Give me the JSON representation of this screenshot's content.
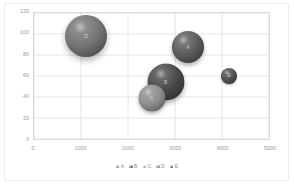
{
  "chart_data": {
    "type": "scatter",
    "subtype": "bubble",
    "title": "",
    "xlabel": "",
    "ylabel": "",
    "xlim": [
      0,
      5000
    ],
    "ylim": [
      0,
      120
    ],
    "xticks": [
      "0",
      "1000",
      "2000",
      "3000",
      "4000",
      "5000"
    ],
    "xtick_values": [
      0,
      1000,
      2000,
      3000,
      4000,
      5000
    ],
    "yticks": [
      "0",
      "20",
      "40",
      "60",
      "80",
      "100",
      "120"
    ],
    "ytick_values": [
      0,
      20,
      40,
      60,
      80,
      100,
      120
    ],
    "grid": true,
    "grid_color": "#d9d9d9",
    "legend_position": "bottom",
    "series": [
      {
        "name": "A",
        "label": "A",
        "x": 3250,
        "y": 88,
        "size": 32,
        "color": "#5a5a5a",
        "radius_px": 16
      },
      {
        "name": "B",
        "label": "B",
        "x": 2780,
        "y": 55,
        "size": 37,
        "color": "#484848",
        "radius_px": 18.5
      },
      {
        "name": "C",
        "label": "C",
        "x": 2480,
        "y": 40,
        "size": 27,
        "color": "#8e8e8e",
        "radius_px": 13.5
      },
      {
        "name": "D",
        "label": "D",
        "x": 1100,
        "y": 98,
        "size": 42,
        "color": "#747474",
        "radius_px": 21
      },
      {
        "name": "E",
        "label": "E",
        "x": 4120,
        "y": 61,
        "size": 16,
        "color": "#4f4f4f",
        "radius_px": 8
      }
    ],
    "legend": [
      {
        "label": "A",
        "color": "#6e6e6e"
      },
      {
        "label": "B",
        "color": "#3f3f3f"
      },
      {
        "label": "C",
        "color": "#9a9a9a"
      },
      {
        "label": "D",
        "color": "#7a7a7a"
      },
      {
        "label": "E",
        "color": "#4a4a4a"
      }
    ]
  }
}
